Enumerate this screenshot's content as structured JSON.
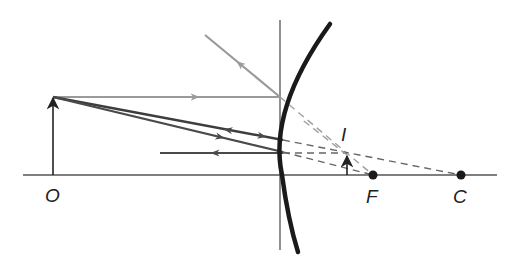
{
  "diagram": {
    "labels": {
      "object": "O",
      "image": "I",
      "focal_point": "F",
      "center_of_curvature": "C"
    },
    "colors": {
      "axis": "#555555",
      "mirror": "#1a1a1a",
      "ray_gray": "#9a9a9a",
      "ray_dark": "#4a4a4a",
      "dashed": "#7a7a7a",
      "point": "#1a1a1a"
    },
    "elements": [
      "principal-axis",
      "mirror-vertex-line",
      "convex-mirror",
      "object-arrow",
      "image-arrow",
      "parallel-ray",
      "reflected-ray",
      "ray-to-center",
      "ray-to-focus",
      "horizontal-reflected-ray",
      "virtual-extensions",
      "focal-point",
      "center-point"
    ]
  }
}
